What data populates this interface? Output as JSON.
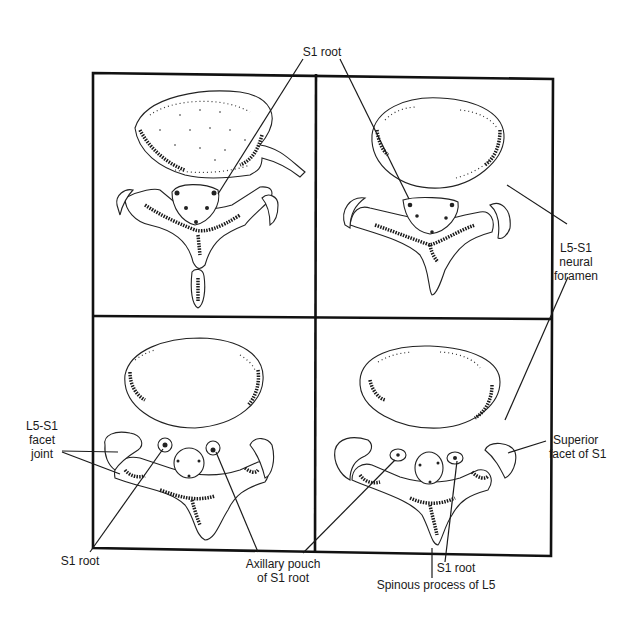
{
  "figure": {
    "panels": [
      {
        "id": "top-left",
        "position": "upper left"
      },
      {
        "id": "top-right",
        "position": "upper right"
      },
      {
        "id": "bottom-left",
        "position": "lower left"
      },
      {
        "id": "bottom-right",
        "position": "lower right"
      }
    ],
    "labels": {
      "s1_root_top": "S1 root",
      "neural_foramen_line1": "L5-S1",
      "neural_foramen_line2": "neural",
      "neural_foramen_line3": "foramen",
      "facet_joint_line1": "L5-S1",
      "facet_joint_line2": "facet",
      "facet_joint_line3": "joint",
      "superior_facet_line1": "Superior",
      "superior_facet_line2": "facet of S1",
      "s1_root_bottom_left": "S1 root",
      "axillary_pouch_line1": "Axillary pouch",
      "axillary_pouch_line2": "of S1 root",
      "s1_root_bottom_right": "S1 root",
      "spinous_process": "Spinous process of L5"
    },
    "colors": {
      "ink": "#1a1a1a",
      "background": "#ffffff"
    }
  }
}
